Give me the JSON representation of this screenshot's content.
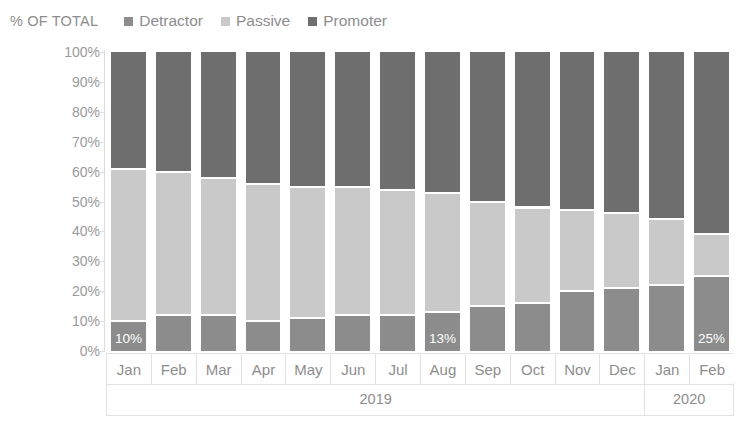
{
  "header": {
    "axis_title": "% OF TOTAL"
  },
  "legend": {
    "position": "top",
    "items": [
      {
        "label": "Detractor",
        "color": "#8c8c8c",
        "icon": "square-marker-icon"
      },
      {
        "label": "Passive",
        "color": "#c9c9c9",
        "icon": "square-marker-icon"
      },
      {
        "label": "Promoter",
        "color": "#6e6e6e",
        "icon": "square-marker-icon"
      }
    ]
  },
  "y_axis": {
    "ticks": [
      "100%",
      "90%",
      "80%",
      "70%",
      "60%",
      "50%",
      "40%",
      "30%",
      "20%",
      "10%",
      "0%"
    ]
  },
  "x_axis": {
    "months": [
      "Jan",
      "Feb",
      "Mar",
      "Apr",
      "May",
      "Jun",
      "Jul",
      "Aug",
      "Sep",
      "Oct",
      "Nov",
      "Dec",
      "Jan",
      "Feb"
    ],
    "years": [
      {
        "label": "2019",
        "span": 12
      },
      {
        "label": "2020",
        "span": 2
      }
    ]
  },
  "chart_data": {
    "type": "bar",
    "stacked": true,
    "normalized": true,
    "title": "",
    "subtitle": "",
    "xlabel": "",
    "ylabel": "% OF TOTAL",
    "ylim": [
      0,
      100
    ],
    "ytick_step": 10,
    "grid": false,
    "legend_position": "top",
    "categories": [
      "Jan",
      "Feb",
      "Mar",
      "Apr",
      "May",
      "Jun",
      "Jul",
      "Aug",
      "Sep",
      "Oct",
      "Nov",
      "Dec",
      "Jan",
      "Feb"
    ],
    "category_groups": [
      "2019",
      "2019",
      "2019",
      "2019",
      "2019",
      "2019",
      "2019",
      "2019",
      "2019",
      "2019",
      "2019",
      "2019",
      "2020",
      "2020"
    ],
    "series": [
      {
        "name": "Detractor",
        "color": "#8c8c8c",
        "stack_order": 0,
        "values": [
          10,
          12,
          12,
          10,
          11,
          12,
          12,
          13,
          15,
          16,
          20,
          21,
          22,
          25
        ]
      },
      {
        "name": "Passive",
        "color": "#c9c9c9",
        "stack_order": 1,
        "values": [
          51,
          48,
          46,
          46,
          44,
          43,
          42,
          40,
          35,
          32,
          27,
          25,
          22,
          14
        ]
      },
      {
        "name": "Promoter",
        "color": "#6e6e6e",
        "stack_order": 2,
        "values": [
          39,
          40,
          42,
          44,
          45,
          45,
          46,
          47,
          50,
          52,
          53,
          54,
          56,
          61
        ]
      }
    ],
    "cumulative_tops": {
      "detractor": [
        10,
        12,
        12,
        10,
        11,
        12,
        12,
        13,
        15,
        16,
        20,
        21,
        22,
        25
      ],
      "passive": [
        61,
        60,
        58,
        56,
        55,
        55,
        54,
        53,
        50,
        48,
        47,
        46,
        44,
        39
      ]
    },
    "data_labels": [
      {
        "category_index": 0,
        "series": "Detractor",
        "text": "10%"
      },
      {
        "category_index": 7,
        "series": "Detractor",
        "text": "13%"
      },
      {
        "category_index": 13,
        "series": "Detractor",
        "text": "25%"
      }
    ]
  }
}
